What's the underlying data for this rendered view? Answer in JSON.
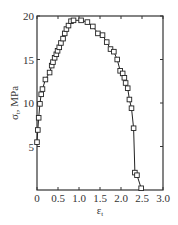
{
  "chart_data": {
    "type": "line",
    "title": "",
    "xlabel": "ε_t",
    "ylabel": "σ_t, MPa",
    "xlim": [
      0,
      3.0
    ],
    "ylim": [
      0,
      20
    ],
    "x_ticks": [
      "0",
      "0.5",
      "1.0",
      "1.5",
      "2.0",
      "2.5",
      "3.0"
    ],
    "y_ticks": [
      "5",
      "10",
      "15",
      "20"
    ],
    "grid": false,
    "legend": null,
    "marker": "open-square",
    "series": [
      {
        "name": "stress-strain",
        "x": [
          0.0,
          0.02,
          0.04,
          0.07,
          0.1,
          0.13,
          0.2,
          0.3,
          0.35,
          0.38,
          0.42,
          0.46,
          0.49,
          0.53,
          0.57,
          0.62,
          0.66,
          0.7,
          0.75,
          0.81,
          0.87,
          1.05,
          1.2,
          1.33,
          1.45,
          1.56,
          1.66,
          1.75,
          1.83,
          1.91,
          1.98,
          2.04,
          2.08,
          2.11,
          2.16,
          2.2,
          2.25,
          2.3,
          2.33,
          2.38,
          2.48
        ],
        "y": [
          5.5,
          6.9,
          8.3,
          9.9,
          11.0,
          11.6,
          12.7,
          13.5,
          14.3,
          14.7,
          15.2,
          15.6,
          16.0,
          16.4,
          16.9,
          17.4,
          18.0,
          18.5,
          18.9,
          19.4,
          19.5,
          19.5,
          19.3,
          18.8,
          18.0,
          17.8,
          17.0,
          16.2,
          15.9,
          15.0,
          13.7,
          13.4,
          12.9,
          12.3,
          11.7,
          10.4,
          9.4,
          7.1,
          2.0,
          1.7,
          0.2
        ]
      }
    ]
  },
  "labels": {
    "xlabel_main": "ε",
    "xlabel_sub": "t",
    "ylabel_main": "σ",
    "ylabel_sub": "t",
    "ylabel_unit": ", MPa"
  }
}
